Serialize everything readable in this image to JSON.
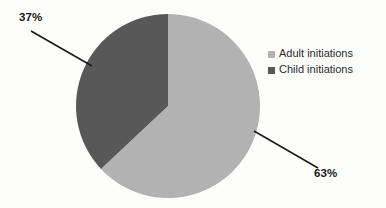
{
  "chart_data": {
    "type": "pie",
    "title": "",
    "subtitle": "",
    "xlabel": "",
    "ylabel": "",
    "categories": [
      "Adult initiations",
      "Child initiations"
    ],
    "values": [
      63,
      37
    ],
    "unit": "%",
    "data_labels": [
      "63%",
      "37%"
    ],
    "legend_position": "right",
    "grid": false,
    "start_angle_deg": 0,
    "direction": "clockwise",
    "slices": [
      {
        "label": "Adult initiations",
        "value": 63,
        "data_label": "63%",
        "color": "#b2b2b2",
        "start_angle_deg": 0,
        "end_angle_deg": 226.8
      },
      {
        "label": "Child initiations",
        "value": 37,
        "data_label": "37%",
        "color": "#585858",
        "start_angle_deg": 226.8,
        "end_angle_deg": 360
      }
    ]
  },
  "legend": {
    "items": [
      {
        "label": "Adult initiations",
        "color": "#b2b2b2",
        "swatch_icon": "legend-swatch-square"
      },
      {
        "label": "Child initiations",
        "color": "#585858",
        "swatch_icon": "legend-swatch-square"
      }
    ]
  },
  "annotations": {
    "adult_callout": "63%",
    "child_callout": "37%"
  },
  "colors": {
    "background": "#fdfdfc",
    "adult_slice": "#b2b2b2",
    "child_slice": "#585858",
    "leader_line": "#1a1a1a",
    "label_text": "#171717",
    "legend_text": "#2b2b2b"
  }
}
